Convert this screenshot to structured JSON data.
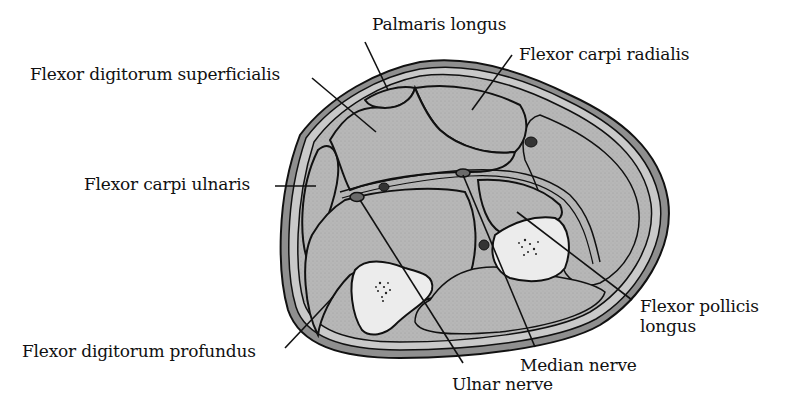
{
  "diagram": {
    "colors": {
      "skin": "#8f8f8f",
      "subcutaneous": "#c9c9c9",
      "muscle": "#b4b4b4",
      "bone": "#ececec",
      "outline": "#111111",
      "nerve": "#6a6a6a",
      "background": "#ffffff"
    },
    "labels": [
      {
        "id": "palmaris-longus",
        "text": "Palmaris longus"
      },
      {
        "id": "flexor-carpi-radialis",
        "text": "Flexor carpi radialis"
      },
      {
        "id": "flexor-digitorum-superficialis",
        "text": "Flexor digitorum superficialis"
      },
      {
        "id": "flexor-carpi-ulnaris",
        "text": "Flexor carpi ulnaris"
      },
      {
        "id": "flexor-pollicis-longus-1",
        "text": "Flexor pollicis"
      },
      {
        "id": "flexor-pollicis-longus-2",
        "text": "longus"
      },
      {
        "id": "flexor-digitorum-profundus",
        "text": "Flexor digitorum profundus"
      },
      {
        "id": "median-nerve",
        "text": "Median nerve"
      },
      {
        "id": "ulnar-nerve",
        "text": "Ulnar nerve"
      }
    ]
  }
}
